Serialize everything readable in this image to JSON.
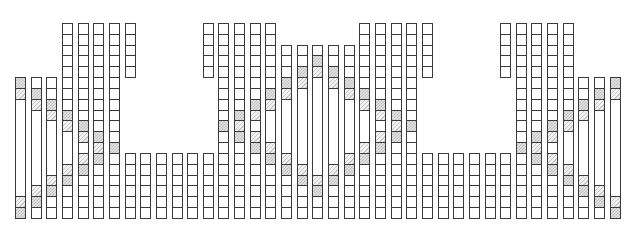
{
  "diagram": {
    "grid": {
      "x0": 15,
      "col_pitch": 15.65,
      "cell_width": 11,
      "y0": 23,
      "row_pitch": 10.83,
      "rows": 18,
      "columns_count": 39
    },
    "legend": {
      "b": "blank-cell",
      "d": "dotted-crosshatch-cell",
      "h": "diagonal-hatch-cell",
      "M": "merged-blank-cell (followed by row span)"
    },
    "colors": {
      "border": "#3a3a3a",
      "background": "#ffffff",
      "dot_fill": "#bdbdbd",
      "hatch_fill": "#c8c8c8"
    },
    "columns": [
      [
        "5:dhM9hd"
      ],
      [
        "5:bdhM7hdb"
      ],
      [
        "5:bbdhM5hdbb"
      ],
      [
        "0:bbbbbbbbdhM3hdbbb"
      ],
      [
        "0:bbbbbbbbbdhbhdbbbb"
      ],
      [
        "0:bbbbbbbbbbdhdbbbbb"
      ],
      [
        "0:bbbbbbbbbbbdbbbbbb"
      ],
      [
        "0:bbbbb",
        "12:bbbbbb"
      ],
      [
        "12:bbbbbb"
      ],
      [
        "12:bbbbbb"
      ],
      [
        "12:bbbbbb"
      ],
      [
        "12:bbbbbb"
      ],
      [
        "0:bbbbb",
        "12:bbbbbb"
      ],
      [
        "0:bbbbbbbbbdbbbbbbbb"
      ],
      [
        "0:bbbbbbbbdhdbbbbbbb"
      ],
      [
        "0:bbbbbbbdhbhdbbbbbb"
      ],
      [
        "0:bbbbbbdhM3hdbbbbb"
      ],
      [
        "2:bbbdhM5hdbbbb"
      ],
      [
        "2:bbdhM7hdbbb"
      ],
      [
        "2:bdhM9hdbb"
      ],
      [
        "2:bbdhM7hdbbb"
      ],
      [
        "2:bbbdhM5hdbbbb"
      ],
      [
        "0:bbbbbbdhM3hdbbbbb"
      ],
      [
        "0:bbbbbbbdhbhdbbbbbb"
      ],
      [
        "0:bbbbbbbbdhdbbbbbbb"
      ],
      [
        "0:bbbbbbbbbdbbbbbbbb"
      ],
      [
        "0:bbbbb",
        "12:bbbbbb"
      ],
      [
        "12:bbbbbb"
      ],
      [
        "12:bbbbbb"
      ],
      [
        "12:bbbbbb"
      ],
      [
        "12:bbbbbb"
      ],
      [
        "0:bbbbb",
        "12:bbbbbb"
      ],
      [
        "0:bbbbbbbbbbbdbbbbbb"
      ],
      [
        "0:bbbbbbbbbbdhdbbbbb"
      ],
      [
        "0:bbbbbbbbbdhbhdbbbb"
      ],
      [
        "0:bbbbbbbbdhM3hdbbb"
      ],
      [
        "5:bbdhM5hdbb"
      ],
      [
        "5:bdhM7hdb"
      ],
      [
        "5:dhM9hd"
      ]
    ]
  }
}
